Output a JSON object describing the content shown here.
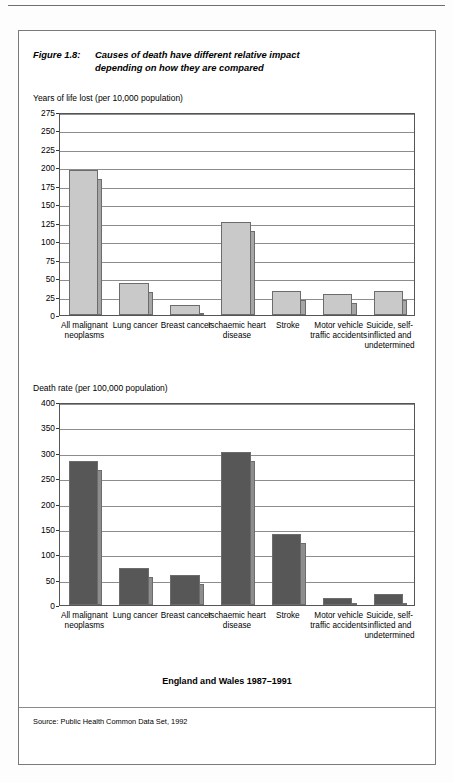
{
  "figure": {
    "number_label": "Figure 1.8:",
    "title_line1": "Causes of death have different relative impact",
    "title_line2": "depending on how they are compared",
    "region_note": "England and Wales 1987–1991",
    "source_note": "Source: Public Health Common Data Set, 1992"
  },
  "colors": {
    "chart1_bar": "#c9c9c9",
    "chart1_shadow": "#a6a6a6",
    "chart2_bar": "#575757",
    "chart2_shadow": "#8d8d8d",
    "grid": "#8d8d8d",
    "frame": "#555555",
    "page_border": "#7a7a7a"
  },
  "chart_data": [
    {
      "type": "bar",
      "id": "years-of-life-lost",
      "title": "",
      "ylabel": "Years of  life lost (per 10,000 population)",
      "xlabel": "",
      "ylim": [
        0,
        275
      ],
      "yticks": [
        275,
        250,
        225,
        200,
        175,
        150,
        125,
        100,
        75,
        50,
        25,
        0
      ],
      "ytick_labels": [
        "275",
        "250",
        "225",
        "200",
        "175",
        "150",
        "125",
        "100",
        "75",
        "50",
        "25",
        "0"
      ],
      "grid": true,
      "legend": "none",
      "categories": [
        "All malignant neoplasms",
        "Lung cancer",
        "Breast cancer",
        "Ischaemic heart disease",
        "Stroke",
        "Motor vehicle traffic accidents",
        "Suicide, self-inflicted and undetermined"
      ],
      "values": [
        197,
        43,
        13,
        126,
        32,
        28,
        33
      ]
    },
    {
      "type": "bar",
      "id": "death-rate",
      "title": "",
      "ylabel": "Death rate (per 100,000 population)",
      "xlabel": "",
      "ylim": [
        0,
        400
      ],
      "yticks": [
        400,
        350,
        300,
        250,
        200,
        150,
        100,
        50,
        0
      ],
      "ytick_labels": [
        "400",
        "350",
        "300",
        "250",
        "200",
        "150",
        "100",
        "50",
        "0"
      ],
      "grid": true,
      "legend": "none",
      "categories": [
        "All malignant neoplasms",
        "Lung cancer",
        "Breast cancer",
        "Ischaemic heart disease",
        "Stroke",
        "Motor vehicle traffic accidents",
        "Suicide, self-inflicted and undetermined"
      ],
      "values": [
        283,
        73,
        60,
        302,
        140,
        14,
        21
      ]
    }
  ]
}
